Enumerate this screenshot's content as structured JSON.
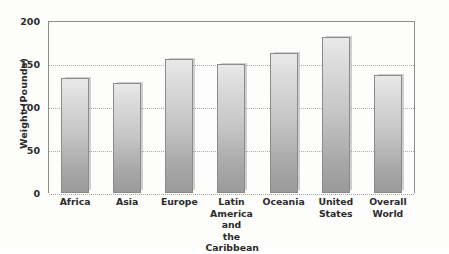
{
  "chart_data": {
    "type": "bar",
    "title": "",
    "xlabel": "",
    "ylabel": "Weight (Pounds)",
    "ylim": [
      0,
      200
    ],
    "yticks": [
      0,
      50,
      100,
      150,
      200
    ],
    "grid": "horizontal-dotted",
    "legend": "none",
    "categories": [
      "Africa",
      "Asia",
      "Europe",
      "Latin America and the Caribbean",
      "Oceania",
      "United States",
      "Overall World"
    ],
    "category_lines": [
      [
        "Africa"
      ],
      [
        "Asia"
      ],
      [
        "Europe"
      ],
      [
        "Latin",
        "America and",
        "the Caribbean"
      ],
      [
        "Oceania"
      ],
      [
        "United",
        "States"
      ],
      [
        "Overall",
        "World"
      ]
    ],
    "values": [
      134,
      128,
      156,
      150,
      163,
      181,
      137
    ],
    "bar_fill_top": "#e9e9e9",
    "bar_fill_bottom": "#9a9a9a",
    "bar_outline": "#8a8a8a",
    "gridline_color": "#a9a9a9",
    "axis_color": "#8d8d8d",
    "text_color": "#2b2b2b",
    "background": "#fdfdfc"
  }
}
